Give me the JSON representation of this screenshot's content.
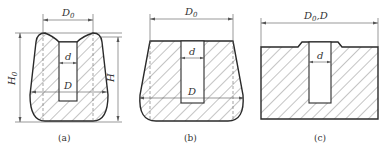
{
  "figure": {
    "panels": [
      {
        "id": "a",
        "caption": "(a)",
        "labels": {
          "top_width": "D",
          "top_width_sub": "0",
          "slot_width": "d",
          "bottom_width": "D",
          "left_height": "H",
          "left_height_sub": "0",
          "right_height": "H"
        }
      },
      {
        "id": "b",
        "caption": "(b)",
        "labels": {
          "top_width": "D",
          "top_width_sub": "0",
          "slot_width": "d",
          "bottom_width": "D"
        }
      },
      {
        "id": "c",
        "caption": "(c)",
        "labels": {
          "top_width": "D",
          "top_width_sub": "0",
          "top_width_suffix": ",D",
          "slot_width": "d"
        }
      }
    ],
    "colors": {
      "stroke": "#2a2a2a",
      "hatch": "#555555",
      "background": "#ffffff"
    }
  }
}
